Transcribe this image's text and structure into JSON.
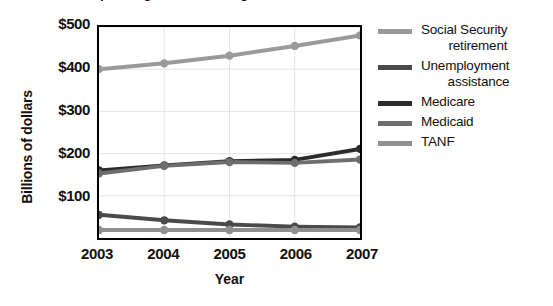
{
  "chart_data": {
    "type": "line",
    "title": "Federal Spending on Social Programs, 2003 - 2007",
    "xlabel": "Year",
    "ylabel": "Billions of dollars",
    "categories": [
      "2003",
      "2004",
      "2005",
      "2006",
      "2007"
    ],
    "x": [
      2003,
      2004,
      2005,
      2006,
      2007
    ],
    "ylim": [
      0,
      500
    ],
    "yticks": [
      "$100",
      "$200",
      "$300",
      "$400",
      "$500"
    ],
    "ytick_values": [
      100,
      200,
      300,
      400,
      500
    ],
    "grid": true,
    "legend_position": "right",
    "markers": "circle",
    "series": [
      {
        "name": "Social Security retirement",
        "color": "#9a9a9a",
        "values": [
          400,
          414,
          432,
          455,
          480
        ]
      },
      {
        "name": "Unemployment assistance",
        "color": "#4a4a4a",
        "values": [
          55,
          42,
          32,
          27,
          25
        ]
      },
      {
        "name": "Medicare",
        "color": "#2b2b2b",
        "values": [
          160,
          172,
          182,
          185,
          211
        ]
      },
      {
        "name": "Medicaid",
        "color": "#6e6e6e",
        "values": [
          153,
          171,
          180,
          178,
          186
        ]
      },
      {
        "name": "TANF",
        "color": "#8f8f8f",
        "values": [
          19,
          19,
          19,
          19,
          19
        ]
      }
    ]
  },
  "legend": {
    "items": [
      {
        "label_line1": "Social Security",
        "label_line2": "retirement"
      },
      {
        "label_line1": "Unemployment",
        "label_line2": "assistance"
      },
      {
        "label_line1": "Medicare",
        "label_line2": ""
      },
      {
        "label_line1": "Medicaid",
        "label_line2": ""
      },
      {
        "label_line1": "TANF",
        "label_line2": ""
      }
    ]
  }
}
